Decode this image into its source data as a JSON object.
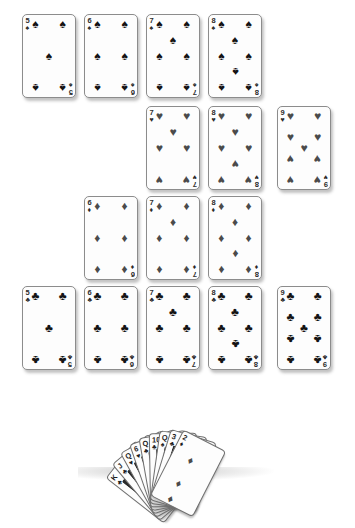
{
  "scene": {
    "title": "Playing card spread with fanned hand",
    "background_color": "#ffffff",
    "suit_glyphs": {
      "spades": "♠",
      "hearts": "♥",
      "diamonds": "♦",
      "clubs": "♣"
    },
    "suit_colors": {
      "spades": "#141414",
      "hearts": "#4b4b4b",
      "diamonds": "#4b4b4b",
      "clubs": "#141414"
    }
  },
  "rows": [
    {
      "row_name": "spades-row",
      "suit": "spades",
      "suit_glyph": "♠",
      "suit_class": "suit-black",
      "top": 14,
      "cards": [
        {
          "rank": "5",
          "suit": "spades",
          "label": "5 of spades",
          "left": 22
        },
        {
          "rank": "6",
          "suit": "spades",
          "label": "6 of spades",
          "left": 84
        },
        {
          "rank": "7",
          "suit": "spades",
          "label": "7 of spades",
          "left": 146
        },
        {
          "rank": "8",
          "suit": "spades",
          "label": "8 of spades",
          "left": 208
        }
      ]
    },
    {
      "row_name": "hearts-row",
      "suit": "hearts",
      "suit_glyph": "♥",
      "suit_class": "suit-gray",
      "top": 106,
      "cards": [
        {
          "rank": "7",
          "suit": "hearts",
          "label": "7 of hearts",
          "left": 146
        },
        {
          "rank": "8",
          "suit": "hearts",
          "label": "8 of hearts",
          "left": 208
        },
        {
          "rank": "9",
          "suit": "hearts",
          "label": "9 of hearts",
          "left": 277
        }
      ]
    },
    {
      "row_name": "diamonds-row",
      "suit": "diamonds",
      "suit_glyph": "♦",
      "suit_class": "suit-gray",
      "top": 196,
      "cards": [
        {
          "rank": "6",
          "suit": "diamonds",
          "label": "6 of diamonds",
          "left": 84
        },
        {
          "rank": "7",
          "suit": "diamonds",
          "label": "7 of diamonds",
          "left": 146
        },
        {
          "rank": "8",
          "suit": "diamonds",
          "label": "8 of diamonds",
          "left": 208
        }
      ]
    },
    {
      "row_name": "clubs-row",
      "suit": "clubs",
      "suit_glyph": "♣",
      "suit_class": "suit-black",
      "top": 286,
      "cards": [
        {
          "rank": "5",
          "suit": "clubs",
          "label": "5 of clubs",
          "left": 22
        },
        {
          "rank": "6",
          "suit": "clubs",
          "label": "6 of clubs",
          "left": 84
        },
        {
          "rank": "7",
          "suit": "clubs",
          "label": "7 of clubs",
          "left": 146
        },
        {
          "rank": "8",
          "suit": "clubs",
          "label": "8 of clubs",
          "left": 208
        },
        {
          "rank": "9",
          "suit": "clubs",
          "label": "9 of clubs",
          "left": 277
        }
      ]
    }
  ],
  "fan": {
    "name": "fanned-hand",
    "card_count": 9,
    "cards": [
      {
        "rank": "K",
        "suit": "clubs",
        "suit_glyph": "♣",
        "label": "King of clubs",
        "rotate": -52,
        "order": 1
      },
      {
        "rank": "J",
        "suit": "clubs",
        "suit_glyph": "♣",
        "label": "Jack of clubs",
        "rotate": -40,
        "order": 2
      },
      {
        "rank": "Q",
        "suit": "hearts",
        "suit_glyph": "♥",
        "label": "Queen of hearts",
        "rotate": -29,
        "order": 3
      },
      {
        "rank": "6",
        "suit": "hearts",
        "suit_glyph": "♥",
        "label": "6 of hearts",
        "rotate": -19,
        "order": 4
      },
      {
        "rank": "Q",
        "suit": "clubs",
        "suit_glyph": "♣",
        "label": "Queen of clubs",
        "rotate": -10,
        "order": 5
      },
      {
        "rank": "10",
        "suit": "clubs",
        "suit_glyph": "♣",
        "label": "10 of clubs",
        "rotate": -1,
        "order": 6
      },
      {
        "rank": "Q",
        "suit": "spades",
        "suit_glyph": "♠",
        "label": "Queen of spades",
        "rotate": 8,
        "order": 7
      },
      {
        "rank": "3",
        "suit": "clubs",
        "suit_glyph": "♣",
        "label": "3 of clubs",
        "rotate": 17,
        "order": 8
      },
      {
        "rank": "2",
        "suit": "diamonds",
        "suit_glyph": "♦",
        "label": "2 of diamonds",
        "rotate": 27,
        "order": 9
      }
    ]
  }
}
